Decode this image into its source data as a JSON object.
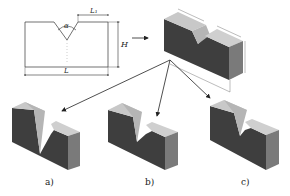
{
  "schematic": {
    "angle_label": "α",
    "top_width_label": "L₁",
    "height_label": "H",
    "length_label": "L"
  },
  "reference_model": {
    "dimension_labels_legible": false
  },
  "variants": [
    {
      "caption": "a)",
      "notch": "deep narrow V"
    },
    {
      "caption": "b)",
      "notch": "medium V"
    },
    {
      "caption": "c)",
      "notch": "shallow wide V"
    }
  ],
  "colors": {
    "face_front": "#3e3e3e",
    "face_top": "#c8c8c8",
    "face_side": "#7a7a7a",
    "notch_face": "#b5b5b5",
    "line": "#333333"
  }
}
